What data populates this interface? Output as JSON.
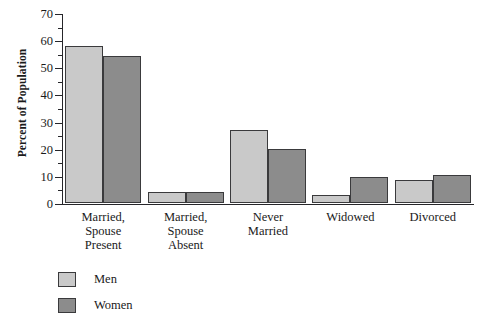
{
  "chart_data": {
    "type": "bar",
    "title": "",
    "xlabel": "",
    "ylabel": "Percent of Population",
    "ylim": [
      0,
      70
    ],
    "ytick_step": 10,
    "yminor_step": 5,
    "grid": false,
    "legend_position": "bottom-left",
    "yticks": [
      0,
      10,
      20,
      30,
      40,
      50,
      60,
      70
    ],
    "ytick_labels": [
      "0",
      "10",
      "20",
      "30",
      "40",
      "50",
      "60",
      "70"
    ],
    "categories": [
      "Married,\nSpouse\nPresent",
      "Married,\nSpouse\nAbsent",
      "Never\nMarried",
      "Widowed",
      "Divorced"
    ],
    "series": [
      {
        "name": "Men",
        "color": "#c9c9c9",
        "values": [
          58,
          4,
          27,
          3,
          8.5
        ]
      },
      {
        "name": "Women",
        "color": "#8c8c8c",
        "values": [
          54,
          4,
          20,
          9.5,
          10.5
        ]
      }
    ]
  },
  "legend": {
    "items": [
      {
        "label": "Men",
        "color": "#c9c9c9"
      },
      {
        "label": "Women",
        "color": "#8c8c8c"
      }
    ]
  },
  "colors": {
    "men": "#c9c9c9",
    "women": "#8c8c8c",
    "axis": "#26262a",
    "bar_outline": "#3a3a3c",
    "background": "#ffffff"
  }
}
